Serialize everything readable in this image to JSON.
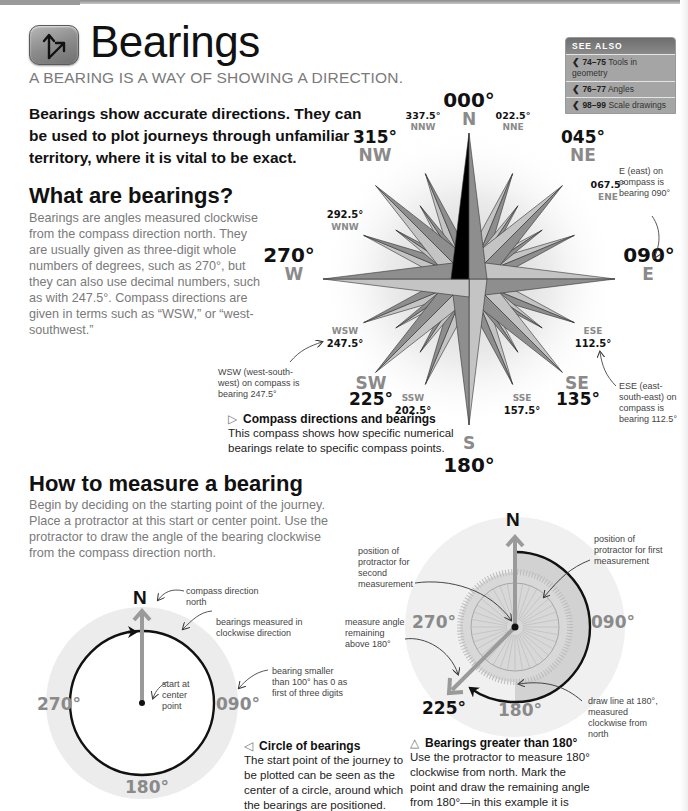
{
  "header": {
    "icon": "bearing-arrows-icon",
    "title": "Bearings",
    "subtitle": "A BEARING IS A WAY OF SHOWING A DIRECTION.",
    "intro": "Bearings show accurate directions. They can be used to plot journeys through unfamiliar territory, where it is vital to be exact."
  },
  "see_also": {
    "heading": "SEE ALSO",
    "items": [
      {
        "arrow": "❮",
        "pages": "74–75",
        "label": "Tools in geometry"
      },
      {
        "arrow": "❮",
        "pages": "76–77",
        "label": "Angles"
      },
      {
        "arrow": "❮",
        "pages": "98–99",
        "label": "Scale drawings"
      }
    ]
  },
  "what_are_bearings": {
    "heading": "What are bearings?",
    "body": "Bearings are angles measured clockwise from the compass direction north. They are usually given as three-digit whole numbers of degrees, such as 270°, but they can also use decimal numbers, such as with 247.5°. Compass directions are given in terms such as “WSW,” or “west-southwest.”"
  },
  "compass": {
    "points": [
      {
        "deg": "000°",
        "dir": "N"
      },
      {
        "deg": "022.5°",
        "dir": "NNE"
      },
      {
        "deg": "045°",
        "dir": "NE"
      },
      {
        "deg": "067.5°",
        "dir": "ENE"
      },
      {
        "deg": "090°",
        "dir": "E"
      },
      {
        "deg": "112.5°",
        "dir": "ESE"
      },
      {
        "deg": "135°",
        "dir": "SE"
      },
      {
        "deg": "157.5°",
        "dir": "SSE"
      },
      {
        "deg": "180°",
        "dir": "S"
      },
      {
        "deg": "202.5°",
        "dir": "SSW"
      },
      {
        "deg": "225°",
        "dir": "SW"
      },
      {
        "deg": "247.5°",
        "dir": "WSW"
      },
      {
        "deg": "270°",
        "dir": "W"
      },
      {
        "deg": "292.5°",
        "dir": "WNW"
      },
      {
        "deg": "315°",
        "dir": "NW"
      },
      {
        "deg": "337.5°",
        "dir": "NNW"
      }
    ],
    "annotation_east": "E (east) on compass is bearing 090°",
    "annotation_wsw": "WSW (west-south-west) on compass is bearing 247.5°",
    "annotation_ese": "ESE (east-south-east) on compass is bearing 112.5°",
    "caption_marker": "▷",
    "caption_title": "Compass directions and bearings",
    "caption_body": "This compass shows how specific numerical bearings relate to specific compass points."
  },
  "how_to_measure": {
    "heading": "How to measure a bearing",
    "body": "Begin by deciding on the starting point of the journey. Place a protractor at this start or center point. Use the protractor to draw the angle of the bearing clockwise from the compass direction north."
  },
  "circle_diagram": {
    "north": "N",
    "labels": {
      "east": "090°",
      "south": "180°",
      "west": "270°"
    },
    "ann_north": "compass direction north",
    "ann_clockwise": "bearings measured in clockwise direction",
    "ann_smaller": "bearing smaller than 100° has 0 as first of three digits",
    "ann_center": "start at center point",
    "caption_marker": "◁",
    "caption_title": "Circle of bearings",
    "caption_body": "The start point of the journey to be plotted can be seen as the center of a circle, around which the bearings are positioned."
  },
  "greater_diagram": {
    "north": "N",
    "labels": {
      "east": "090°",
      "south": "180°",
      "west": "270°",
      "result": "225°"
    },
    "ann_second": "position of protractor for second measurement",
    "ann_first": "position of protractor for first measurement",
    "ann_remaining": "measure angle remaining above 180°",
    "ann_draw": "draw line at 180°, measured clockwise from north",
    "caption_marker": "△",
    "caption_title": "Bearings greater than 180°",
    "caption_body": "Use the protractor to measure 180° clockwise from north. Mark the point and draw the remaining angle from 180°—in this example it is 225°."
  },
  "colors": {
    "dark_text": "#111111",
    "gray_text": "#7a7a7a",
    "rose_light": "#c4c4c4",
    "rose_dark": "#8e8e8e",
    "north_point": "#000000",
    "panel_gray": "#a5a5a5"
  }
}
